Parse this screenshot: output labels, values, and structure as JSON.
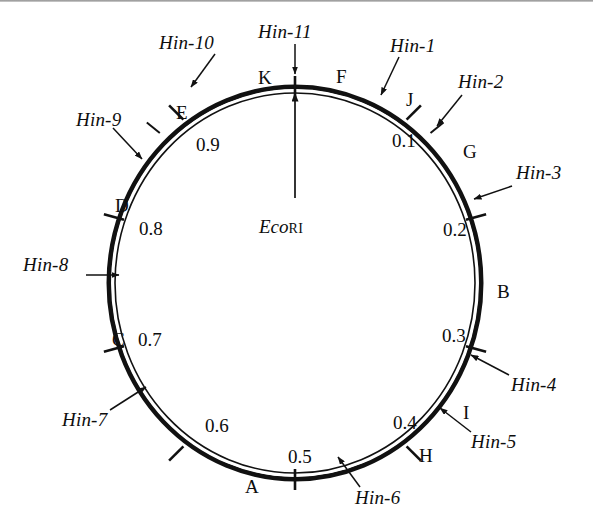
{
  "figure": {
    "name": "circular-restriction-map",
    "type": "circular genome map",
    "ring": {
      "center": [
        295,
        283
      ],
      "radius_x": 185,
      "radius_y": 195,
      "stroke_color": "#111111"
    },
    "origin_marker": {
      "label_italic": "Eco",
      "label_smallcaps": "RI",
      "full_label": "EcoRI",
      "position_on_circle": 0.0,
      "arrow": "points up to top of circle"
    },
    "map_units_note": "fractional map units 0.0-1.0 clockwise from EcoRI site"
  },
  "coordinates": [
    {
      "value": "0.1",
      "x": 392,
      "y": 131
    },
    {
      "value": "0.2",
      "x": 443,
      "y": 220
    },
    {
      "value": "0.3",
      "x": 442,
      "y": 326
    },
    {
      "value": "0.4",
      "x": 393,
      "y": 413
    },
    {
      "value": "0.5",
      "x": 298,
      "y": 447
    },
    {
      "value": "0.6",
      "x": 212,
      "y": 416
    },
    {
      "value": "0.7",
      "x": 144,
      "y": 330
    },
    {
      "value": "0.8",
      "x": 145,
      "y": 219
    },
    {
      "value": "0.9",
      "x": 203,
      "y": 135
    }
  ],
  "fragments": [
    {
      "letter": "F",
      "x": 336,
      "y": 67
    },
    {
      "letter": "J",
      "x": 406,
      "y": 90
    },
    {
      "letter": "G",
      "x": 463,
      "y": 142
    },
    {
      "letter": "B",
      "x": 497,
      "y": 282
    },
    {
      "letter": "I",
      "x": 463,
      "y": 403
    },
    {
      "letter": "H",
      "x": 419,
      "y": 446
    },
    {
      "letter": "A",
      "x": 245,
      "y": 477
    },
    {
      "letter": "C",
      "x": 112,
      "y": 330
    },
    {
      "letter": "D",
      "x": 115,
      "y": 196
    },
    {
      "letter": "E",
      "x": 176,
      "y": 103
    },
    {
      "letter": "K",
      "x": 258,
      "y": 68
    }
  ],
  "sites": [
    {
      "name": "Hin-1",
      "x": 390,
      "y": 45
    },
    {
      "name": "Hin-2",
      "x": 458,
      "y": 81
    },
    {
      "name": "Hin-3",
      "x": 516,
      "y": 172
    },
    {
      "name": "Hin-4",
      "x": 511,
      "y": 384
    },
    {
      "name": "Hin-5",
      "x": 471,
      "y": 441
    },
    {
      "name": "Hin-6",
      "x": 355,
      "y": 497
    },
    {
      "name": "Hin-7",
      "x": 68,
      "y": 419
    },
    {
      "name": "Hin-8",
      "x": 30,
      "y": 262
    },
    {
      "name": "Hin-9",
      "x": 80,
      "y": 117
    },
    {
      "name": "Hin-10",
      "x": 164,
      "y": 41
    },
    {
      "name": "Hin-11",
      "x": 283,
      "y": 28
    }
  ],
  "colors": {
    "ink": "#111111",
    "background": "#ffffff",
    "top_edge": "#8a8a8a"
  }
}
